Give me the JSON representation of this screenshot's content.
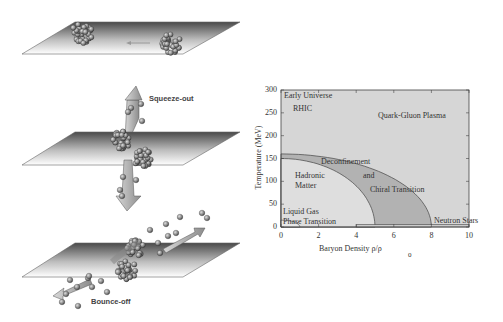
{
  "figure": {
    "left_panels": [
      {
        "id": "approach",
        "label": "",
        "plane": {
          "top_y": 22,
          "bottom_y": 54,
          "top_x0": 75,
          "top_x1": 240,
          "bot_x0": 22,
          "bot_x1": 183
        },
        "nuclei": [
          {
            "cx": 82,
            "cy": 33,
            "r": 13
          },
          {
            "cx": 170,
            "cy": 43,
            "r": 13
          }
        ],
        "motion_arrow": {
          "x1": 150,
          "x2": 128,
          "y": 43
        }
      },
      {
        "id": "squeeze-out",
        "label": "Squeeze-out",
        "plane": {
          "top_y": 132,
          "bottom_y": 165,
          "top_x0": 75,
          "top_x1": 240,
          "bot_x0": 22,
          "bot_x1": 183
        }
      },
      {
        "id": "bounce-off",
        "label": "Bounce-off",
        "plane": {
          "top_y": 243,
          "bottom_y": 277,
          "top_x0": 75,
          "top_x1": 240,
          "bot_x0": 22,
          "bot_x1": 183
        }
      }
    ],
    "colors": {
      "plane_dark": "#4a4a4a",
      "plane_light": "#ffffff",
      "nucleon": "#8a8a8a",
      "nucleon_edge": "#3a3a3a",
      "arrow_fill": "#b4b4b4",
      "outer_region": "#d6d6d6",
      "band_region": "#b2b2b2",
      "hadron_region": "#dedede",
      "axis": "#444444",
      "text": "#333333"
    }
  },
  "chart_data": {
    "type": "diagram",
    "xlabel": "Baryon Density ρ/ρ",
    "xlabel_sub": "0",
    "ylabel": "Temperature (MeV)",
    "xlim": [
      0,
      10
    ],
    "ylim": [
      0,
      300
    ],
    "xticks": [
      0,
      2,
      4,
      6,
      8,
      10
    ],
    "yticks": [
      0,
      50,
      100,
      150,
      200,
      250,
      300
    ],
    "grid": false,
    "regions": [
      {
        "name": "Quark-Gluon Plasma",
        "label_at": [
          5.5,
          255
        ]
      },
      {
        "name": "Hadronic Matter",
        "label_at": [
          1.2,
          105
        ]
      },
      {
        "name": "Deconfinement and Chiral Transition",
        "band": {
          "inner": {
            "T0": 150,
            "rho0": 5.0
          },
          "outer": {
            "T0": 160,
            "rho0": 8.0
          }
        }
      }
    ],
    "annotations": [
      {
        "text": "Early Universe",
        "x": 0.1,
        "y": 285
      },
      {
        "text": "RHIC",
        "x": 0.6,
        "y": 255
      },
      {
        "text": "Quark-Gluon Plasma",
        "x": 5.5,
        "y": 250
      },
      {
        "text": "Deconfinement",
        "x": 2.2,
        "y": 128
      },
      {
        "text": "Hadronic",
        "x": 0.7,
        "y": 102
      },
      {
        "text": "Matter",
        "x": 0.7,
        "y": 82
      },
      {
        "text": "and",
        "x": 4.4,
        "y": 100
      },
      {
        "text": "Chiral Transition",
        "x": 4.7,
        "y": 65
      },
      {
        "text": "Liquid Gas",
        "x": 0.1,
        "y": 30
      },
      {
        "text": "Phase Transition",
        "x": 0.1,
        "y": 8
      },
      {
        "text": "Neutron Stars",
        "x": 8.3,
        "y": 8
      }
    ],
    "liquid_gas_curve": {
      "rho_max": 1.0,
      "T_max": 15
    },
    "neutron_star_strip": {
      "rho_min": 4.0,
      "rho_max": 10.0,
      "T_max": 5
    }
  },
  "plot_box": {
    "left": 281,
    "right": 469,
    "top": 90,
    "bottom": 227
  },
  "labels": {
    "squeeze_out": "Squeeze-out",
    "bounce_off": "Bounce-off",
    "early_universe": "Early Universe",
    "rhic": "RHIC",
    "qgp": "Quark-Gluon Plasma",
    "deconfinement": "Deconfinement",
    "and": "and",
    "chiral": "Chiral Transition",
    "hadronic": "Hadronic",
    "matter": "Matter",
    "liquid_gas": "Liquid Gas",
    "phase_transition": "Phase Transition",
    "neutron_stars": "Neutron Stars",
    "xlabel": "Baryon Density ρ/ρ",
    "xlabel_sub": "0",
    "ylabel": "Temperature (MeV)",
    "yticks": [
      "0",
      "50",
      "100",
      "150",
      "200",
      "250",
      "300"
    ],
    "xticks": [
      "0",
      "2",
      "4",
      "6",
      "8",
      "10"
    ]
  }
}
